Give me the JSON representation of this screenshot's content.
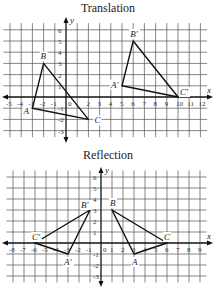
{
  "chart_data": [
    {
      "type": "scatter",
      "title": "Translation",
      "xlabel": "x",
      "ylabel": "y",
      "xlim": [
        -5,
        12
      ],
      "ylim": [
        -3,
        6
      ],
      "grid": true,
      "x_ticks": [
        -5,
        -4,
        -3,
        -2,
        -1,
        0,
        2,
        3,
        4,
        5,
        6,
        7,
        8,
        9,
        10,
        11,
        12
      ],
      "y_ticks": [
        -3,
        -2,
        -1,
        1,
        2,
        3,
        4,
        5,
        6
      ],
      "series": [
        {
          "name": "Triangle ABC",
          "closed": true,
          "points": [
            {
              "label": "A",
              "x": -3,
              "y": -1
            },
            {
              "label": "B",
              "x": -2,
              "y": 3
            },
            {
              "label": "C",
              "x": 2,
              "y": -2
            }
          ]
        },
        {
          "name": "Triangle A'B'C'",
          "closed": true,
          "points": [
            {
              "label": "A′",
              "x": 5,
              "y": 1
            },
            {
              "label": "B′",
              "x": 6,
              "y": 5
            },
            {
              "label": "C′",
              "x": 10,
              "y": 0
            }
          ]
        }
      ]
    },
    {
      "type": "scatter",
      "title": "Reflection",
      "xlabel": "x",
      "ylabel": "y",
      "xlim": [
        -8,
        9
      ],
      "ylim": [
        -3,
        6
      ],
      "grid": true,
      "x_ticks": [
        -8,
        -7,
        -6,
        -5,
        -4,
        -3,
        -2,
        -1,
        0,
        1,
        2,
        3,
        4,
        5,
        6,
        7,
        8,
        9
      ],
      "y_ticks": [
        -3,
        -2,
        -1,
        1,
        2,
        3,
        4,
        5,
        6
      ],
      "series": [
        {
          "name": "Triangle ABC",
          "closed": true,
          "points": [
            {
              "label": "A",
              "x": 3,
              "y": -1
            },
            {
              "label": "B",
              "x": 1,
              "y": 3
            },
            {
              "label": "C",
              "x": 6,
              "y": 0
            }
          ]
        },
        {
          "name": "Triangle A'B'C'",
          "closed": true,
          "points": [
            {
              "label": "A′",
              "x": -3,
              "y": -1
            },
            {
              "label": "B′",
              "x": -1,
              "y": 3
            },
            {
              "label": "C′",
              "x": -6,
              "y": 0
            }
          ]
        }
      ]
    }
  ],
  "translation": {
    "title": "Translation"
  },
  "reflection": {
    "title": "Reflection"
  }
}
